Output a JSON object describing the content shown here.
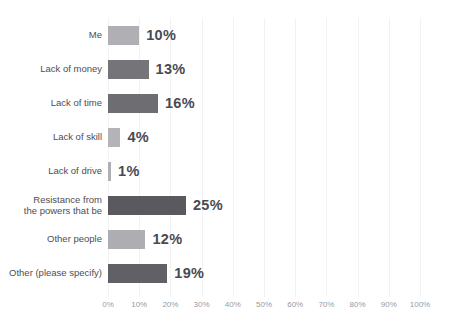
{
  "chart_data": {
    "type": "bar",
    "orientation": "horizontal",
    "title": "",
    "xlabel": "",
    "ylabel": "",
    "xlim": [
      0,
      100
    ],
    "grid": true,
    "legend": false,
    "value_suffix": "%",
    "categories": [
      "Me",
      "Lack of money",
      "Lack of time",
      "Lack of skill",
      "Lack of drive",
      "Resistance from\nthe powers that be",
      "Other people",
      "Other (please specify)"
    ],
    "values": [
      10,
      13,
      16,
      4,
      1,
      25,
      12,
      19
    ],
    "value_labels": [
      "10%",
      "13%",
      "16%",
      "4%",
      "1%",
      "25%",
      "12%",
      "19%"
    ],
    "bar_colors": [
      "#b0b0b4",
      "#757579",
      "#6e6e72",
      "#b4b4b8",
      "#b0b0b4",
      "#5a5a5e",
      "#aeaeb2",
      "#616165"
    ],
    "xticks": [
      0,
      10,
      20,
      30,
      40,
      50,
      60,
      70,
      80,
      90,
      100
    ],
    "xtick_labels": [
      "0%",
      "10%",
      "20%",
      "30%",
      "40%",
      "50%",
      "60%",
      "70%",
      "80%",
      "90%",
      "100%"
    ]
  },
  "style": {
    "background": "#ffffff",
    "gridline_color": "#f2f2f4",
    "label_color": "#4d4d55",
    "value_color": "#4a4a52",
    "tick_color": "#9a9aa2"
  }
}
